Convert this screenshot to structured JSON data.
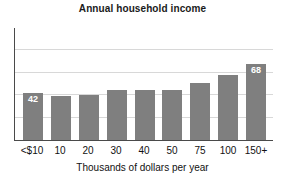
{
  "chart_data": {
    "type": "bar",
    "title": "Annual household income",
    "xlabel": "Thousands of dollars per year",
    "ylabel": "",
    "categories": [
      "<$10",
      "10",
      "20",
      "30",
      "40",
      "50",
      "75",
      "100",
      "150+"
    ],
    "values": [
      42,
      39,
      40,
      45,
      45,
      45,
      51,
      58,
      68
    ],
    "point_labels": [
      "42",
      "",
      "",
      "",
      "",
      "",
      "",
      "",
      "68"
    ],
    "ylim": [
      0,
      100
    ],
    "gridlines": [
      20,
      40,
      60,
      80
    ],
    "grid": true,
    "legend": "none",
    "bar_color": "#7f7f7f",
    "label_color": "#ffffff",
    "axis_color": "#4a4a4a",
    "grid_color": "#d8d8d8"
  }
}
